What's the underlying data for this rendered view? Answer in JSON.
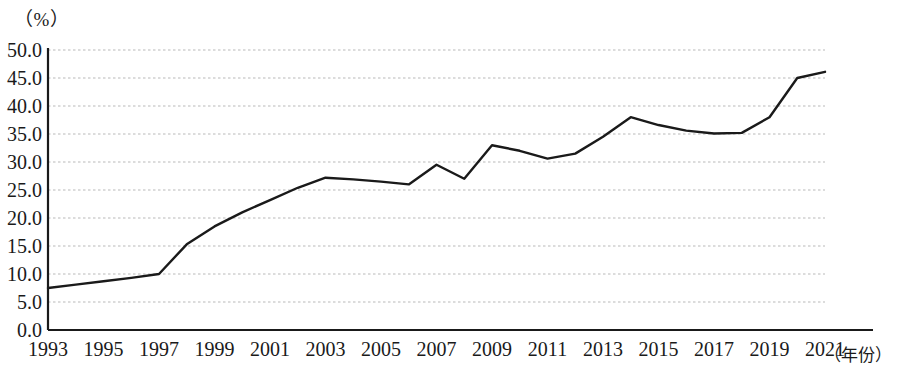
{
  "chart_data": {
    "type": "line",
    "title": "",
    "subtitle": "",
    "xlabel": "（年份）",
    "ylabel": "（%）",
    "ylim": [
      0.0,
      50.0
    ],
    "xlim": [
      1993,
      2021
    ],
    "grid": true,
    "grid_axis": "y",
    "legend": false,
    "legend_position": "none",
    "y_ticks": [
      "0.0",
      "5.0",
      "10.0",
      "15.0",
      "20.0",
      "25.0",
      "30.0",
      "35.0",
      "40.0",
      "45.0",
      "50.0"
    ],
    "y_tick_values": [
      0.0,
      5.0,
      10.0,
      15.0,
      20.0,
      25.0,
      30.0,
      35.0,
      40.0,
      45.0,
      50.0
    ],
    "x_ticks": [
      "1993",
      "1995",
      "1997",
      "1999",
      "2001",
      "2003",
      "2005",
      "2007",
      "2009",
      "2011",
      "2013",
      "2015",
      "2017",
      "2019",
      "2021"
    ],
    "x_tick_values": [
      1993,
      1995,
      1997,
      1999,
      2001,
      2003,
      2005,
      2007,
      2009,
      2011,
      2013,
      2015,
      2017,
      2019,
      2021
    ],
    "line_color": "#1a1a1a",
    "grid_color": "#b9b9b9",
    "axis_color": "#1a1a1a",
    "x": [
      1993,
      1994,
      1995,
      1996,
      1997,
      1998,
      1999,
      2000,
      2001,
      2002,
      2003,
      2004,
      2005,
      2006,
      2007,
      2008,
      2009,
      2010,
      2011,
      2012,
      2013,
      2014,
      2015,
      2016,
      2017,
      2018,
      2019,
      2020,
      2021
    ],
    "values": [
      7.5,
      8.1,
      8.7,
      9.3,
      10.0,
      15.3,
      18.5,
      21.0,
      23.2,
      25.4,
      27.2,
      26.9,
      26.5,
      26.0,
      29.5,
      27.0,
      33.0,
      32.0,
      30.6,
      31.5,
      34.5,
      38.0,
      36.6,
      35.6,
      35.1,
      35.2,
      38.0,
      45.0,
      46.1
    ],
    "series": [
      {
        "name": "",
        "values": [
          7.5,
          8.1,
          8.7,
          9.3,
          10.0,
          15.3,
          18.5,
          21.0,
          23.2,
          25.4,
          27.2,
          26.9,
          26.5,
          26.0,
          29.5,
          27.0,
          33.0,
          32.0,
          30.6,
          31.5,
          34.5,
          38.0,
          36.6,
          35.6,
          35.1,
          35.2,
          38.0,
          45.0,
          46.1
        ]
      }
    ]
  }
}
